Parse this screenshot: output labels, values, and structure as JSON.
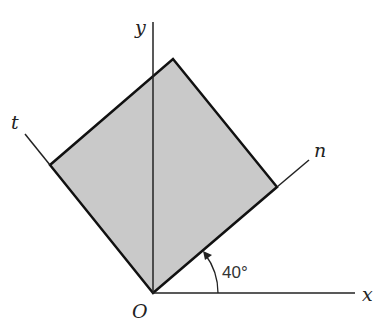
{
  "labels": {
    "x": "x",
    "y": "y",
    "n": "n",
    "t": "t",
    "origin": "O",
    "angle": "40°"
  },
  "colors": {
    "fill": "#c8c8c8",
    "stroke": "#111111"
  }
}
